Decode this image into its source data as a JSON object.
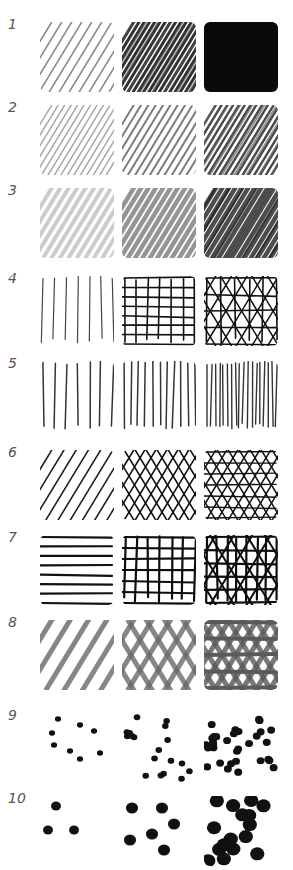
{
  "colors": {
    "ink": "#111111",
    "pencil_light": "#9a9a9a",
    "pencil_mid": "#6e6e6e",
    "marker_grey": "#7a7a7a",
    "label": "#555555"
  },
  "rows": [
    {
      "label": "1",
      "top": 14,
      "swatches": [
        "soft pencil diagonal hatch - light",
        "soft pencil diagonal hatch - dense",
        "soft pencil solid fill"
      ]
    },
    {
      "label": "2",
      "top": 97,
      "swatches": [
        "fine diagonal hatch - light grey",
        "fine diagonal hatch - mid grey",
        "fine diagonal hatch - dark grey"
      ]
    },
    {
      "label": "3",
      "top": 180,
      "swatches": [
        "tonal diagonal wash - light",
        "tonal diagonal wash - mid",
        "tonal diagonal wash - dark"
      ]
    },
    {
      "label": "4",
      "top": 268,
      "swatches": [
        "sparse vertical lines",
        "square grid crosshatch",
        "grid plus diagonal crosshatch"
      ]
    },
    {
      "label": "5",
      "top": 353,
      "swatches": [
        "vertical lines - wide spacing",
        "vertical lines - medium spacing",
        "vertical lines - tight spacing"
      ]
    },
    {
      "label": "6",
      "top": 442,
      "swatches": [
        "diagonal parallel lines",
        "diagonal crosshatch",
        "triple crosshatch"
      ]
    },
    {
      "label": "7",
      "top": 527,
      "swatches": [
        "horizontal lines",
        "bold square grid",
        "bold grid with diagonals"
      ]
    },
    {
      "label": "8",
      "top": 612,
      "swatches": [
        "broad marker diagonal strokes",
        "broad marker crosshatch",
        "broad marker dense crosshatch"
      ]
    },
    {
      "label": "9",
      "top": 705,
      "swatches": [
        "small dots - sparse",
        "small dots - medium",
        "small dots - dense"
      ]
    },
    {
      "label": "10",
      "top": 788,
      "swatches": [
        "large dots - sparse",
        "large dots - medium",
        "large dots - dense"
      ]
    }
  ]
}
